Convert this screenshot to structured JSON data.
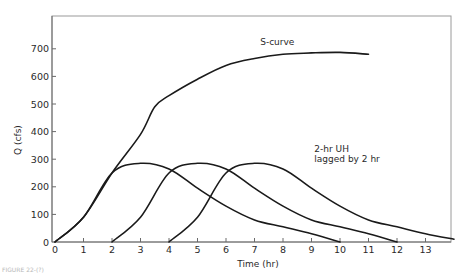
{
  "chart_data": {
    "type": "line",
    "title": "",
    "xlabel": "Time (hr)",
    "ylabel": "Q (cfs)",
    "xlim": [
      0,
      14
    ],
    "ylim": [
      0,
      800
    ],
    "x_ticks": [
      0,
      1,
      2,
      3,
      4,
      5,
      6,
      7,
      8,
      9,
      10,
      11,
      12,
      13
    ],
    "y_ticks": [
      0,
      100,
      200,
      300,
      400,
      500,
      600,
      700
    ],
    "grid": false,
    "legend": "none",
    "series": [
      {
        "name": "S-curve",
        "x": [
          0,
          1,
          2,
          3,
          3.5,
          4,
          5,
          6,
          7,
          8,
          9,
          10,
          11
        ],
        "y": [
          0,
          90,
          250,
          390,
          490,
          530,
          590,
          640,
          665,
          680,
          685,
          687,
          680
        ]
      },
      {
        "name": "2-hr UH",
        "x": [
          0,
          1,
          2,
          3,
          4,
          5,
          6,
          7,
          8,
          9,
          10
        ],
        "y": [
          0,
          90,
          250,
          285,
          265,
          195,
          130,
          80,
          55,
          30,
          0
        ]
      },
      {
        "name": "2-hr UH lagged by 2 hr",
        "x": [
          2,
          3,
          4,
          5,
          6,
          7,
          8,
          9,
          10,
          11,
          12
        ],
        "y": [
          0,
          90,
          250,
          285,
          265,
          195,
          130,
          80,
          55,
          30,
          0
        ]
      },
      {
        "name": "2-hr UH lagged by 4 hr",
        "x": [
          4,
          5,
          6,
          7,
          8,
          9,
          10,
          11,
          12,
          13,
          14
        ],
        "y": [
          0,
          90,
          250,
          285,
          265,
          195,
          130,
          80,
          55,
          30,
          10
        ]
      }
    ],
    "annotations": [
      {
        "text": "S-curve",
        "x": 7.2,
        "y": 715
      },
      {
        "text": "2-hr UH",
        "x": 9.1,
        "y": 325
      },
      {
        "text": "lagged by 2 hr",
        "x": 9.1,
        "y": 290
      }
    ]
  },
  "caption": "FIGURE 22-(?)"
}
